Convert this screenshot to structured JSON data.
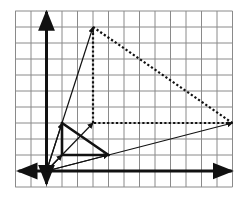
{
  "diagram": {
    "title": "",
    "grid": {
      "x_min": -2,
      "x_max": 12,
      "y_min": -1,
      "y_max": 10,
      "origin_px": [
        46.5,
        171
      ],
      "unit_px_x": 15.5,
      "unit_px_y": 16,
      "line_color": "#8a8a8a"
    },
    "axes": {
      "color": "#111111",
      "x_arrow_left": -2,
      "x_arrow_right": 12,
      "y_arrow_top": 10,
      "y_arrow_bottom": -1
    },
    "thin_vectors": [
      {
        "from": [
          0,
          0
        ],
        "to": [
          1,
          1
        ]
      },
      {
        "from": [
          0,
          0
        ],
        "to": [
          3,
          3
        ]
      },
      {
        "from": [
          0,
          0
        ],
        "to": [
          1,
          3
        ]
      },
      {
        "from": [
          0,
          0
        ],
        "to": [
          3,
          9
        ]
      },
      {
        "from": [
          0,
          0
        ],
        "to": [
          4,
          1
        ]
      },
      {
        "from": [
          0,
          0
        ],
        "to": [
          12,
          3
        ]
      }
    ],
    "small_triangle": {
      "style": "solid-thick",
      "vertices": [
        [
          1,
          1
        ],
        [
          1,
          3
        ],
        [
          4,
          1
        ]
      ]
    },
    "large_triangle": {
      "style": "dotted",
      "vertices": [
        [
          3,
          3
        ],
        [
          3,
          9
        ],
        [
          12,
          3
        ]
      ]
    }
  }
}
